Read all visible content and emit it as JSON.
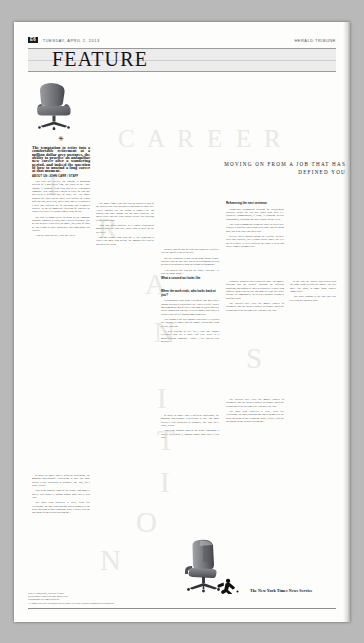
{
  "folio": {
    "page_number": "E6",
    "date": "TUESDAY, APRIL 2, 2013",
    "section": "HERALD TRIBUNE"
  },
  "masthead": {
    "word": "FEATURE"
  },
  "headline": {
    "watermark_career": "CAREER",
    "watermark_transition": "TRANSITION",
    "deck": "MOVING ON FROM A JOB THAT HAS DEFINED YOU"
  },
  "images": {
    "chair_top": "office-chair-photo",
    "chair_bottom": "office-chair-photo"
  },
  "columns": {
    "col1": {
      "ornament": "✳",
      "lede": "The temptation to retire into a comfortable retirement at a million dollar grey pastures, the ability to practice an unfamiliar new career after a wandering period, and indeed the question of how to unwind a long career at that moment.",
      "byline": "ABOUT US: JOHN CARR / STAFF",
      "paras": [
        "Last year Bill Drew's, the Boston, a managing director of a mid sized firm, but when in the AMC Boston, a financial firm with had to be a managed company—but what did it mean to leave the job that had been a defining part of adult life. The move stopped the clock on the thirty year identity of a man different and, as he was, partly paid, and yet it provided a new and different set of questions and a smaller appetite to do an immediate question of whether he could ever really tell people simply what he did.",
        "The shift is almost never as quick as the company brochure suggests, he said, and it arrives in stages. One or two or three years after the move, the sense of what he did seems to have sharpened into something else entirely.",
        "\"You are who you are,\" said Mr. Drew."
      ]
    },
    "col2": {
      "paras": [
        "The move from a job that was an identity is one of the hardest and least discussed transitions in adult life. Career coaches say the reason is simple: the job supplies not only income but the daily structure, the social circle and the ready answer to the first question at any dinner table.",
        "That loss often surfaces as a vague restlessness months after the final day, rather than as grief on the day itself.",
        "For the people who plan for it, the transition is easier. For those who do not, the months after can be unexpectedly bleak."
      ],
      "subhead1": "When the work ends, who looks back at you?",
      "paras2": [
        "Psychologists who study retirement and mid career change describe a predictable arc. There is relief, then a honeymoon period of travel and long delayed projects, then a trough that can last a year or longer, and finally a rebuilt sense of self around something new.",
        "The trough is the part nobody advertises. It is when the calendar is empty and the phone, which once rang all day, does not.",
        "\"I kept waiting to feel free,\" said one former executive who left a thirty two year career at a manufacturing company. \"What I felt instead was invisible.\"",
        "Counselors recommend building the replacement structure before the last day rather than after it—volunteer commitments, a class, a standing weekly appointment, anything that puts a shape on the week.",
        "They also recommend telling the story in a new way. Practice a sentence that begins with what you are doing now, not with what you used to be."
      ],
      "subhead2": "Rehearsing the next sentence",
      "paras3": [
        "Several career coaches assign the exercise literally: write one sentence, say it aloud twenty times, use it at the next party. It feels artificial for about a week and then it simply becomes true."
      ]
    },
    "col3": {
      "paras": [
        "identity, and the loss of a job that supplied it can feel like the loss of a part of the self.",
        "But the transition is also an opening. Many people discover that the role they had been performing for two decades was narrower than the person performing it.",
        "\"The hardest part was not the work,\" said one. \"It was the name badge.\""
      ],
      "paras2": [
        "Financial planners add a practical note: the money question and the identity question are different problems and should be solved separately. People who conflate them tend to stay too long in a job they have already left emotionally, or to leave abruptly without a plan for either.",
        "The advised rule: treat the money project as arithmetic and the identity project as design. Build the second one with the same care you gave the first.",
        "In the end, the people interviewed said the same thing in different words. The title goes. The work, in some form, usually comes back.",
        "And what remains is the part that was never on the business card."
      ],
      "subhead": "What a second act looks like"
    },
    "col4": {
      "paras": [
        "In order to move into a different profession, the ongoing conventional expectation is that you must accept a step backward in seniority, pay and, for a while, status.",
        "That is the bargain. Most of the people who made it said it was worth it, though almost none said it was easy.",
        "The ones who regretted it were, with few exceptions, the ones who had not asked themselves the basic question before resigning: what, exactly, was the job doing for me besides paying me?"
      ]
    }
  },
  "footer": {
    "credit_line1": "Career Transitions, a weekly feature.",
    "credit_line2": "Reporting by John Carr and Marta Ellis.",
    "credit_line3": "Photographs by Sam Whitfield.",
    "credit_line4": "All rights reserved. Reproduction in whole or in part without permission is prohibited.",
    "logo_text": "The New York Times News Service",
    "logo_mark": "runner-logo-icon"
  }
}
